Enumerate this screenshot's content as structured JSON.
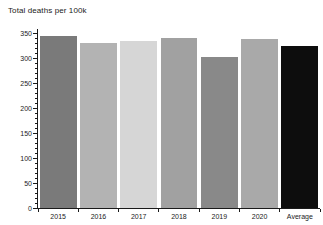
{
  "title": "Total deaths per 100k",
  "chart_data": {
    "type": "bar",
    "title": "Total deaths per 100k",
    "categories": [
      "2015",
      "2016",
      "2017",
      "2018",
      "2019",
      "2020",
      "Average"
    ],
    "values": [
      345,
      330,
      335,
      340,
      303,
      338,
      325
    ],
    "bar_colors": [
      "#7a7a7a",
      "#b3b3b3",
      "#d6d6d6",
      "#a1a1a1",
      "#898989",
      "#a9a9a9",
      "#0d0d0d"
    ],
    "xlabel": "",
    "ylabel": "",
    "ylim": [
      0,
      350
    ],
    "ytick_step": 50,
    "ytick_minor_step": 10,
    "ytick_labels": [
      "0",
      "50",
      "100",
      "150",
      "200",
      "250",
      "300",
      "350"
    ],
    "grid": false,
    "legend_position": "none",
    "background_color": "#ffffff",
    "axis_color": "#1a1a1a",
    "text_color": "#1a1a1a"
  }
}
